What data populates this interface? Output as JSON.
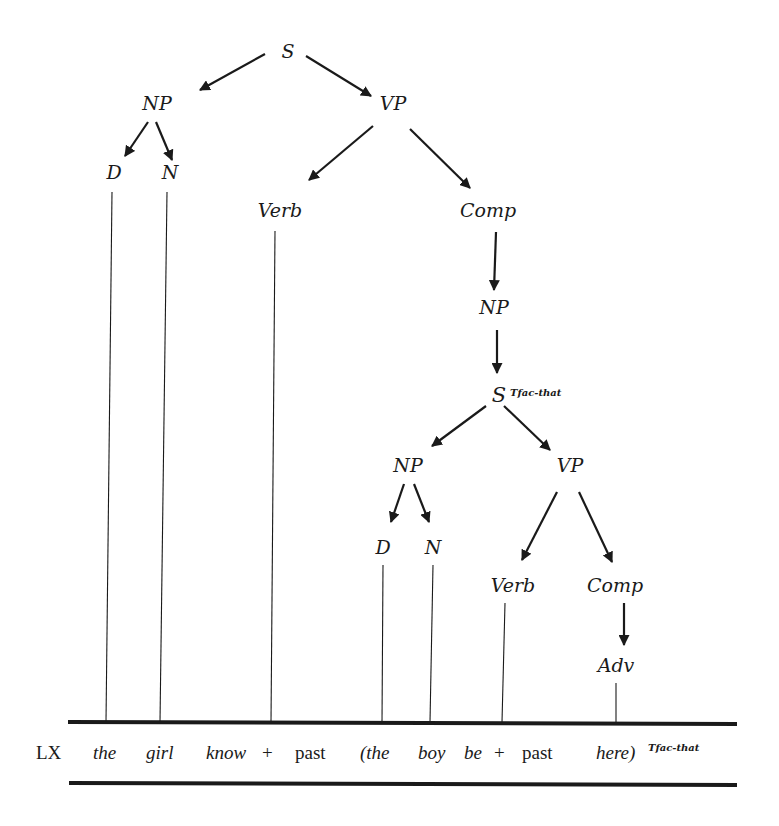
{
  "tree": {
    "root": "S",
    "np1": "NP",
    "vp1": "VP",
    "d1": "D",
    "n1": "N",
    "verb1": "Verb",
    "comp1": "Comp",
    "np2": "NP",
    "s2": "S",
    "s2_superscript": "Tfac-that",
    "np3": "NP",
    "vp2": "VP",
    "d2": "D",
    "n2": "N",
    "verb2": "Verb",
    "comp2": "Comp",
    "adv": "Adv"
  },
  "lexical_row": {
    "label": "LX",
    "tokens": [
      "the",
      "girl",
      "know",
      "+",
      "past",
      "(the",
      "boy",
      "be",
      "+",
      "past",
      "here)"
    ],
    "closing_superscript": "Tfac-that"
  }
}
